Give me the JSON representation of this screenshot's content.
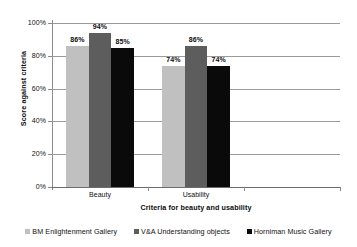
{
  "chart_data": {
    "type": "bar",
    "title": "",
    "xlabel": "Criteria for beauty and usability",
    "ylabel": "Score against criteria",
    "categories": [
      "Beauty",
      "Usability",
      ""
    ],
    "series": [
      {
        "name": "BM Enlightenment Gallery",
        "color": "#c0c0c0",
        "values": [
          86,
          74,
          null
        ],
        "labels": [
          "86%",
          "74%",
          ""
        ]
      },
      {
        "name": "V&A Understanding objects",
        "color": "#5d5d5d",
        "values": [
          94,
          86,
          null
        ],
        "labels": [
          "94%",
          "86%",
          ""
        ]
      },
      {
        "name": "Horniman Music Gallery",
        "color": "#0a0a0a",
        "values": [
          85,
          74,
          null
        ],
        "labels": [
          "85%",
          "74%",
          ""
        ]
      }
    ],
    "ylim": [
      0,
      100
    ],
    "ytick_values": [
      0,
      20,
      40,
      60,
      80,
      100
    ],
    "ytick_labels": [
      "0%",
      "20%",
      "40%",
      "60%",
      "80%",
      "100%"
    ],
    "grid": true,
    "legend_position": "bottom",
    "value_suffix": "%"
  }
}
